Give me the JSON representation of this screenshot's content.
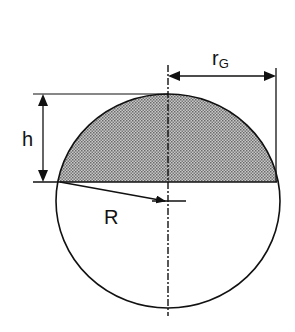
{
  "diagram": {
    "labels": {
      "cap_radius": "r",
      "cap_radius_sub": "G",
      "height": "h",
      "sphere_radius": "R"
    },
    "colors": {
      "stroke": "#111111",
      "cap_fill": "#a8a8a8",
      "background": "#ffffff"
    },
    "geometry": {
      "center": [
        168,
        201
      ],
      "rx": 112,
      "ry": 107,
      "chord_y": 182,
      "top_y": 94
    }
  }
}
